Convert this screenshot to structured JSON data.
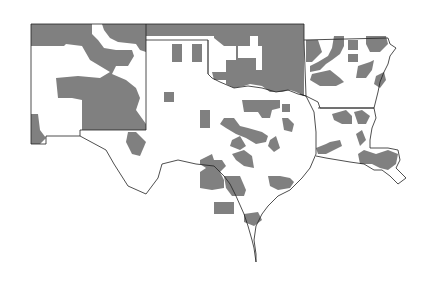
{
  "map": {
    "region": "South-central United States",
    "states": [
      "New Mexico",
      "Texas",
      "Oklahoma",
      "Arkansas",
      "Louisiana"
    ],
    "fill_color": "#808080",
    "background_color": "#ffffff",
    "outline_color": "#222222",
    "legend": null,
    "labels": []
  }
}
